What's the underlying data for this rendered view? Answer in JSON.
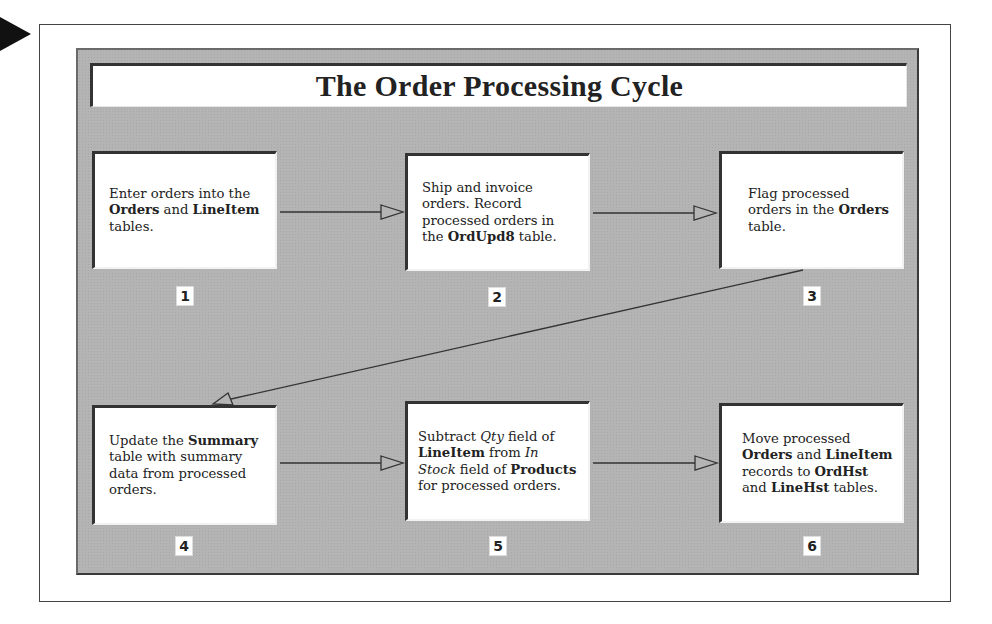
{
  "diagram": {
    "title": "The Order Processing Cycle",
    "steps": [
      {
        "number": "1",
        "segments": [
          {
            "text": "Enter orders into the ",
            "style": "normal"
          },
          {
            "text": "Orders",
            "style": "bold"
          },
          {
            "text": " and ",
            "style": "normal"
          },
          {
            "text": "LineItem",
            "style": "bold"
          },
          {
            "text": " tables.",
            "style": "normal"
          }
        ]
      },
      {
        "number": "2",
        "segments": [
          {
            "text": "Ship and invoice orders. Record processed orders in the ",
            "style": "normal"
          },
          {
            "text": "OrdUpd8",
            "style": "bold"
          },
          {
            "text": " table.",
            "style": "normal"
          }
        ]
      },
      {
        "number": "3",
        "segments": [
          {
            "text": "Flag processed orders in the ",
            "style": "normal"
          },
          {
            "text": "Orders",
            "style": "bold"
          },
          {
            "text": " table.",
            "style": "normal"
          }
        ]
      },
      {
        "number": "4",
        "segments": [
          {
            "text": "Update the ",
            "style": "normal"
          },
          {
            "text": "Summary",
            "style": "bold"
          },
          {
            "text": " table with summary data from processed orders.",
            "style": "normal"
          }
        ]
      },
      {
        "number": "5",
        "segments": [
          {
            "text": "Subtract ",
            "style": "normal"
          },
          {
            "text": "Qty",
            "style": "italic"
          },
          {
            "text": " field of ",
            "style": "normal"
          },
          {
            "text": "LineItem",
            "style": "bold"
          },
          {
            "text": " from ",
            "style": "normal"
          },
          {
            "text": "In Stock",
            "style": "italic"
          },
          {
            "text": " field of ",
            "style": "normal"
          },
          {
            "text": "Products",
            "style": "bold"
          },
          {
            "text": " for processed orders.",
            "style": "normal"
          }
        ]
      },
      {
        "number": "6",
        "segments": [
          {
            "text": "Move processed ",
            "style": "normal"
          },
          {
            "text": "Orders",
            "style": "bold"
          },
          {
            "text": " and ",
            "style": "normal"
          },
          {
            "text": "LineItem",
            "style": "bold"
          },
          {
            "text": " records to ",
            "style": "normal"
          },
          {
            "text": "OrdHst",
            "style": "bold"
          },
          {
            "text": " and ",
            "style": "normal"
          },
          {
            "text": "LineHst",
            "style": "bold"
          },
          {
            "text": " tables.",
            "style": "normal"
          }
        ]
      }
    ],
    "connections": [
      {
        "from": "1",
        "to": "2"
      },
      {
        "from": "2",
        "to": "3"
      },
      {
        "from": "3",
        "to": "4"
      },
      {
        "from": "4",
        "to": "5"
      },
      {
        "from": "5",
        "to": "6"
      }
    ],
    "colors": {
      "panel": "#b4b4b4",
      "box": "#ffffff",
      "line": "#333333",
      "pointer": "#111111"
    }
  }
}
